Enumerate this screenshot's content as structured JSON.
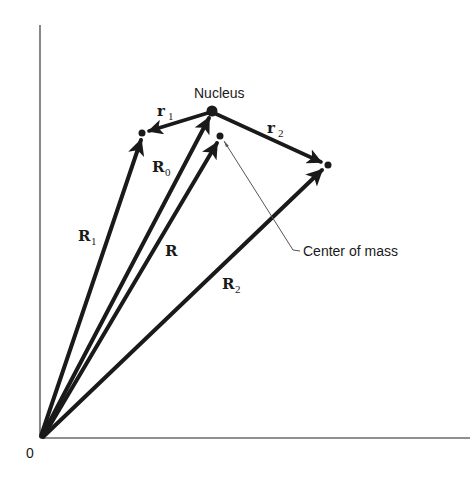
{
  "diagram": {
    "origin_label": "0",
    "labels": {
      "nucleus": "Nucleus",
      "center_of_mass": "Center of mass",
      "r1": {
        "base": "r",
        "sub": "1"
      },
      "r2": {
        "base": "r",
        "sub": "2"
      },
      "R0": {
        "base": "R",
        "sub": "0"
      },
      "R": {
        "base": "R",
        "sub": ""
      },
      "R1": {
        "base": "R",
        "sub": "1"
      },
      "R2": {
        "base": "R",
        "sub": "2"
      }
    },
    "points": {
      "origin": [
        40,
        438
      ],
      "nucleus": [
        212,
        111
      ],
      "particle_1": [
        142,
        133
      ],
      "particle_2": [
        328,
        165
      ],
      "center_of_mass": [
        220,
        136
      ]
    },
    "vectors": [
      {
        "name": "R1",
        "from": "origin",
        "to": "particle_1"
      },
      {
        "name": "R0",
        "from": "origin",
        "to": "nucleus"
      },
      {
        "name": "R",
        "from": "origin",
        "to": "center_of_mass"
      },
      {
        "name": "R2",
        "from": "origin",
        "to": "particle_2"
      },
      {
        "name": "r1",
        "from": "nucleus",
        "to": "particle_1"
      },
      {
        "name": "r2",
        "from": "nucleus",
        "to": "particle_2"
      }
    ]
  }
}
